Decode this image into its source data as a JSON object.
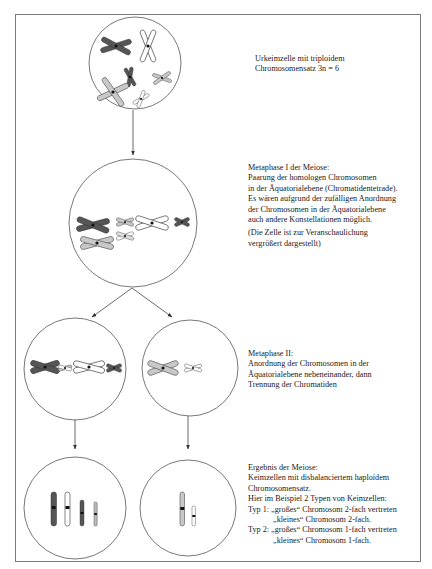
{
  "stages": [
    {
      "id": "urkeimzelle",
      "lines": [
        "Urkeimzelle mit triploidem",
        "Chromosomensatz 3n = 6"
      ]
    },
    {
      "id": "metaphase-1",
      "lines": [
        "Metaphase I der Meiose:",
        "Paarung der homologen Chromosomen",
        "in der Äquatorialebene (Chromatidentetrade).",
        "Es wären aufgrund der zufälligen Anordnung",
        "der Chromosomen in der Äquatorialebene",
        "auch andere Konstellationen möglich."
      ],
      "note_lines": [
        "(Die Zelle ist zur Veranschaulichung",
        "vergrößert dargestellt)"
      ]
    },
    {
      "id": "metaphase-2",
      "lines": [
        "Metaphase II:",
        "Anordnung der Chromosomen in der",
        "Äquatorialebene nebeneinander, dann",
        "Trennung der Chromatiden"
      ]
    },
    {
      "id": "ergebnis",
      "lines": [
        "Ergebnis der Meiose:",
        "Keimzellen mit disbalanciertem haploidem",
        "Chromosomensatz.",
        "Hier im Beispiel 2 Typen von Keimzellen:"
      ],
      "types": [
        {
          "label": "Typ 1:",
          "line1": "„großes“ Chromosom 2-fach vertreten",
          "line2": "„kleines“ Chromosom 2-fach."
        },
        {
          "label": "Typ 2:",
          "line1": "„großes“ Chromosom 1-fach vertreten",
          "line2": "„kleines“ Chromosom 1-fach."
        }
      ]
    }
  ],
  "colors": {
    "frame": "#7a7a7a",
    "line": "#555555",
    "dark": "#555555",
    "light_gray": "#c8c8c8",
    "white": "#ffffff",
    "centromere": "#111111"
  }
}
